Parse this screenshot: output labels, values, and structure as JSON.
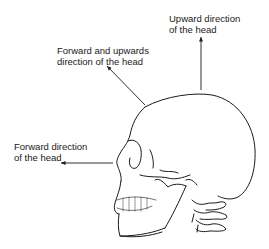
{
  "figure": {
    "labels": {
      "upward": {
        "line1": "Upward direction",
        "line2": "of the head"
      },
      "forward_upward": {
        "line1": "Forward and upwards",
        "line2": "direction of the head"
      },
      "forward": {
        "line1": "Forward direction",
        "line2": "of the head"
      }
    },
    "arrows": [
      {
        "name": "upward-arrow",
        "direction": "up"
      },
      {
        "name": "forward-upward-arrow",
        "direction": "up-left"
      },
      {
        "name": "forward-arrow",
        "direction": "left"
      }
    ],
    "colors": {
      "line": "#1a1a1a",
      "background": "#ffffff"
    }
  }
}
